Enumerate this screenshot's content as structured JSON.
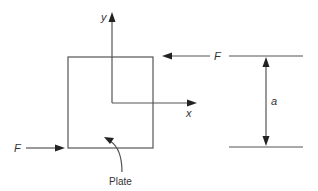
{
  "diagram": {
    "colors": {
      "line": "#555555",
      "arrowhead": "#222222",
      "text": "#333333",
      "background": "#ffffff"
    },
    "plate": {
      "label": "Plate",
      "rect": {
        "x": 68,
        "y": 57,
        "width": 85,
        "height": 91
      }
    },
    "axes": {
      "origin": {
        "x": 112,
        "y": 103
      },
      "x_label": "x",
      "y_label": "y"
    },
    "forces": [
      {
        "label": "F",
        "direction": "left",
        "position": "top-right",
        "y": 56
      },
      {
        "label": "F",
        "direction": "right",
        "position": "bottom-left",
        "y": 148
      }
    ],
    "dimension": {
      "label": "a",
      "description": "vertical distance between lines of action of the two forces",
      "x": 266,
      "y_top": 56,
      "y_bottom": 147
    }
  }
}
